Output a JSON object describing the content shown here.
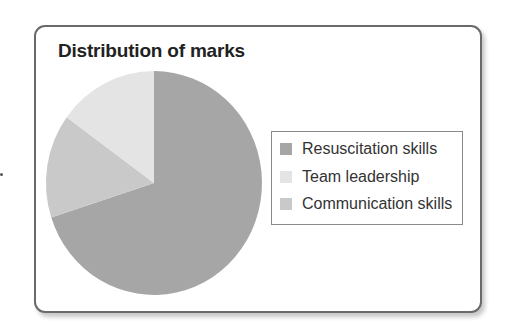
{
  "chart_data": {
    "type": "pie",
    "title": "Distribution of marks",
    "categories": [
      "Resuscitation skills",
      "Team leadership",
      "Communication skills"
    ],
    "values": [
      70,
      15,
      15
    ],
    "colors": [
      "#a6a6a6",
      "#e4e4e4",
      "#c9c9c9"
    ],
    "start_angle_deg": 0,
    "direction": "clockwise",
    "legend_position": "right"
  },
  "legend": {
    "items": [
      {
        "label": "Resuscitation skills",
        "color": "#a6a6a6"
      },
      {
        "label": "Team leadership",
        "color": "#e4e4e4"
      },
      {
        "label": "Communication skills",
        "color": "#c9c9c9"
      }
    ]
  }
}
